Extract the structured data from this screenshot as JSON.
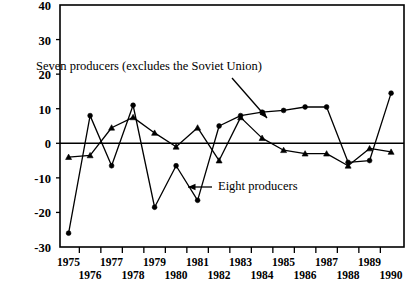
{
  "chart_data": {
    "type": "line",
    "title": "",
    "subtitle": "",
    "xlabel": "",
    "ylabel": "",
    "x": [
      1975,
      1976,
      1977,
      1978,
      1979,
      1980,
      1981,
      1982,
      1983,
      1984,
      1985,
      1986,
      1987,
      1988,
      1989,
      1990
    ],
    "xtick_labels": [
      "1975",
      "1976",
      "1977",
      "1978",
      "1979",
      "1980",
      "1981",
      "1982",
      "1983",
      "1984",
      "1985",
      "1986",
      "1987",
      "1988",
      "1989",
      "1990"
    ],
    "ytick_labels": [
      "40",
      "30",
      "20",
      "10",
      "0",
      "-10",
      "-20",
      "-30"
    ],
    "ytick_values": [
      40,
      30,
      20,
      10,
      0,
      -10,
      -20,
      -30
    ],
    "ylim": [
      -30,
      40
    ],
    "xlim": [
      1974.6,
      1990.6
    ],
    "grid": false,
    "zero_line": 0,
    "legend_position": "none",
    "series": [
      {
        "name": "Seven producers (excludes the Soviet Union)",
        "marker": "circle",
        "values": [
          -26,
          8,
          -6.5,
          11,
          -18.5,
          -6.5,
          -16.5,
          5,
          8,
          9,
          9.5,
          10.5,
          10.5,
          -5.5,
          -5,
          14.5
        ]
      },
      {
        "name": "Eight producers",
        "marker": "triangle",
        "values": [
          -4,
          -3.5,
          4.5,
          7.5,
          3,
          -1,
          4.5,
          -5,
          7.5,
          1.5,
          -2,
          -3,
          -3,
          -6.5,
          -1.5,
          -2.5
        ]
      }
    ],
    "annotations": [
      {
        "id": "seven-producers-label",
        "text": "Seven producers (excludes the Soviet Union)",
        "x_px": 36,
        "y_px": 70,
        "arrow": {
          "from_x_px": 232,
          "from_y_px": 78,
          "to_x_px": 267,
          "to_y_px": 118
        }
      },
      {
        "id": "eight-producers-label",
        "text": "Eight producers",
        "x_px": 218,
        "y_px": 190,
        "arrow": {
          "from_x_px": 212,
          "from_y_px": 187,
          "to_x_px": 188,
          "to_y_px": 187
        }
      }
    ],
    "colors": {
      "line": "#000000",
      "axis": "#000000",
      "background": "#ffffff"
    }
  },
  "plot_frame": {
    "left": 60,
    "right": 404,
    "top": 5,
    "bottom": 247
  }
}
